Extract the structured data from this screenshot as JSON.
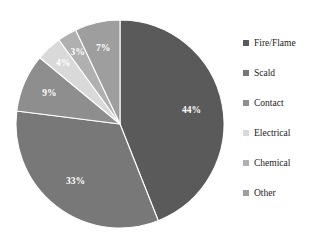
{
  "chart_data": {
    "type": "pie",
    "title": "",
    "categories": [
      "Fire/Flame",
      "Scald",
      "Contact",
      "Electrical",
      "Chemical",
      "Other"
    ],
    "values": [
      44,
      33,
      9,
      4,
      3,
      7
    ],
    "value_labels": [
      "44%",
      "33%",
      "9%",
      "4%",
      "3%",
      "7%"
    ],
    "unit": "%",
    "colors": [
      "#5a5a5a",
      "#787878",
      "#8e8e8e",
      "#d9d9d9",
      "#b0b0b0",
      "#9e9e9e"
    ],
    "label_color": "#ffffff",
    "separator_color": "#ffffff",
    "start_angle_deg": 0,
    "direction": "clockwise",
    "legend_position": "right",
    "grid": false,
    "xlabel": "",
    "ylabel": ""
  },
  "legend": {
    "items": [
      {
        "label": "Fire/Flame",
        "color": "#5a5a5a"
      },
      {
        "label": "Scald",
        "color": "#787878"
      },
      {
        "label": "Contact",
        "color": "#8e8e8e"
      },
      {
        "label": "Electrical",
        "color": "#d9d9d9"
      },
      {
        "label": "Chemical",
        "color": "#b0b0b0"
      },
      {
        "label": "Other",
        "color": "#9e9e9e"
      }
    ]
  }
}
